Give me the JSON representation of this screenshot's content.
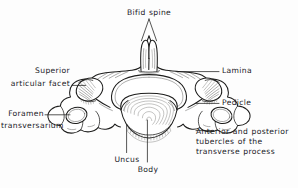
{
  "figure": {
    "background_color": "#fdfdfd",
    "ink_color": "#20201f",
    "line_color": "#1d1d1c"
  },
  "labels": {
    "bifid_spine": "Bifid spine",
    "superior_articular_facet_line1": "Superior",
    "superior_articular_facet_line2": "articular facet",
    "foramen_transversarium_line1": "Foramen",
    "foramen_transversarium_line2": "transversarium",
    "lamina": "Lamina",
    "pedicle": "Pedicle",
    "tubercles_line1": "Anterior and posterior",
    "tubercles_line2": "tubercles of the",
    "tubercles_line3": "transverse process",
    "uncus": "Uncus",
    "body": "Body"
  },
  "structures": [
    {
      "name": "bifid-spine",
      "label": "Bifid spine",
      "position": "top-center"
    },
    {
      "name": "superior-articular-facet",
      "label": "Superior articular facet",
      "position": "left-upper"
    },
    {
      "name": "foramen-transversarium",
      "label": "Foramen transversarium",
      "position": "left-lower"
    },
    {
      "name": "lamina",
      "label": "Lamina",
      "position": "right-upper"
    },
    {
      "name": "pedicle",
      "label": "Pedicle",
      "position": "right-middle"
    },
    {
      "name": "transverse-process-tubercles",
      "label": "Anterior and posterior tubercles of the transverse process",
      "position": "right-lower"
    },
    {
      "name": "uncus",
      "label": "Uncus",
      "position": "bottom-left"
    },
    {
      "name": "body",
      "label": "Body",
      "position": "bottom-center"
    }
  ]
}
